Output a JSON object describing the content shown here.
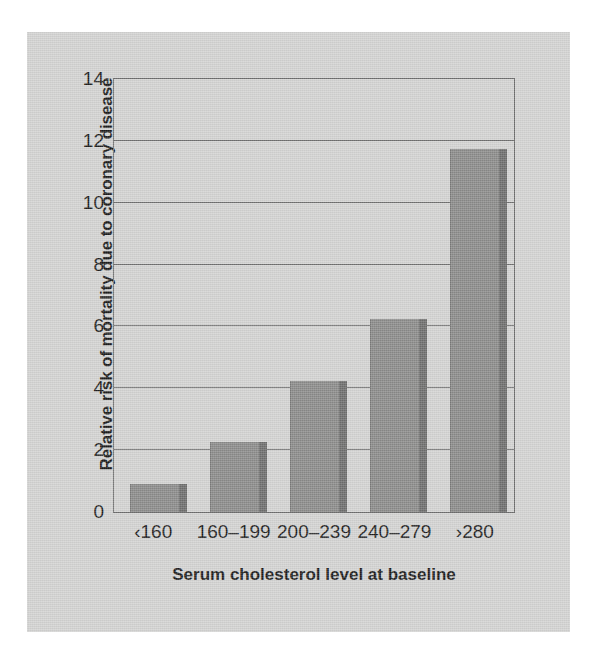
{
  "figure": {
    "background_color": "#d3d3d2",
    "page_color": "#ffffff"
  },
  "chart_data": {
    "type": "bar",
    "title": "",
    "categories": [
      "‹160",
      "160–199",
      "200–239",
      "240–279",
      "›280"
    ],
    "values": [
      0.9,
      2.25,
      4.25,
      6.25,
      11.75
    ],
    "xlabel": "Serum cholesterol level at baseline",
    "ylabel": "Relative risk of mortality due to coronary disease",
    "ylim": [
      0,
      14
    ],
    "yticks": [
      0,
      2,
      4,
      6,
      8,
      10,
      12,
      14
    ],
    "ytick_labels": [
      "0",
      "2",
      "4",
      "6",
      "8",
      "10",
      "12",
      "14"
    ],
    "grid": true,
    "grid_axis": "y",
    "legend": false,
    "bar_color": "#8b8b8a",
    "bar_shadow_color": "#6e6e6d",
    "axis_color": "#6d6d6d",
    "text_color": "#1d1d1d"
  }
}
